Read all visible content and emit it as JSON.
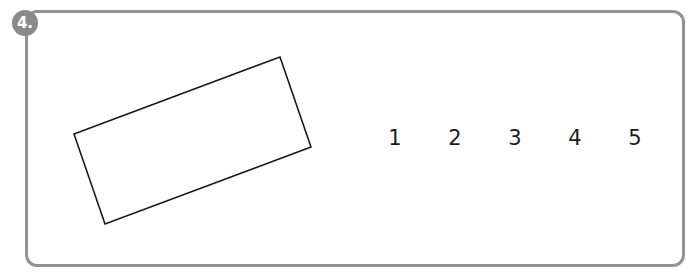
{
  "exercise": {
    "number_label": "4.",
    "shape": {
      "type": "rotated-rectangle",
      "points": [
        [
          74,
          134
        ],
        [
          280,
          57
        ],
        [
          311,
          147
        ],
        [
          105,
          224
        ]
      ],
      "stroke": "#1a1a1a"
    },
    "choices": [
      "1",
      "2",
      "3",
      "4",
      "5"
    ]
  },
  "colors": {
    "frame_border": "#939393",
    "badge_fill": "#8a8a8a"
  }
}
